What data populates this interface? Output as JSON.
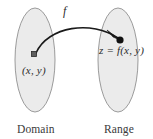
{
  "figure": {
    "type": "function-mapping-diagram",
    "background_color": "#ffffff",
    "ellipse_fill": "#ebebeb",
    "ellipse_stroke": "#9b9b9b",
    "ink_color": "#1a1a1a",
    "labels": {
      "function_label": "f",
      "domain_point": "(x, y)",
      "range_point": "z = f(x, y)",
      "domain_caption": "Domain",
      "range_caption": "Range"
    },
    "shapes": {
      "domain_ellipse": {
        "cx": 35,
        "cy": 60,
        "rx": 20,
        "ry": 52
      },
      "range_ellipse": {
        "cx": 118,
        "cy": 60,
        "rx": 20,
        "ry": 52
      },
      "domain_marker": {
        "x": 34,
        "y": 54,
        "kind": "square-dot"
      },
      "range_marker": {
        "x": 120,
        "y": 40,
        "kind": "round-dot"
      },
      "arrow": {
        "from_x": 36,
        "from_y": 53,
        "to_x": 119,
        "to_y": 39,
        "kind": "curved-arrow"
      }
    }
  }
}
